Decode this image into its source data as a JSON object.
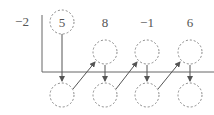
{
  "diagram": {
    "type": "synthetic-division",
    "divisor": "−2",
    "coefficients": [
      "5",
      "8",
      "−1",
      "6"
    ],
    "first_coefficient_circled": "5",
    "upper_row_circles": [
      "",
      "",
      ""
    ],
    "lower_row_circles": [
      "",
      "",
      "",
      ""
    ],
    "colors": {
      "text": "#555555",
      "lines": "#666666",
      "circles": "#888888"
    }
  }
}
